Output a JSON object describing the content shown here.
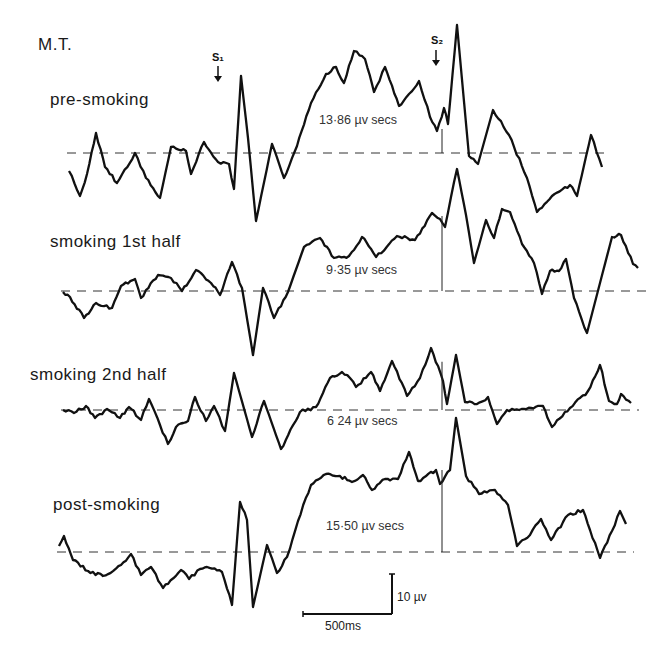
{
  "chart_data": {
    "type": "line",
    "title": "M.T.",
    "xlabel": "",
    "ylabel": "",
    "grid": false,
    "legend": "none",
    "stimulus_markers": [
      {
        "label": "S1",
        "x_px": 218
      },
      {
        "label": "S2",
        "x_px": 436
      }
    ],
    "scale_bar": {
      "time": "500ms",
      "amplitude": "10 µv"
    },
    "series": [
      {
        "name": "pre-smoking",
        "area_label": "13·86 µv secs",
        "baseline_y": 153,
        "points": [
          [
            69,
            171
          ],
          [
            80,
            196
          ],
          [
            87,
            174
          ],
          [
            96,
            133
          ],
          [
            105,
            167
          ],
          [
            117,
            183
          ],
          [
            135,
            153
          ],
          [
            146,
            178
          ],
          [
            160,
            198
          ],
          [
            171,
            147
          ],
          [
            186,
            151
          ],
          [
            191,
            174
          ],
          [
            204,
            142
          ],
          [
            218,
            162
          ],
          [
            229,
            164
          ],
          [
            234,
            189
          ],
          [
            241,
            76
          ],
          [
            248,
            138
          ],
          [
            256,
            221
          ],
          [
            272,
            144
          ],
          [
            284,
            178
          ],
          [
            297,
            146
          ],
          [
            311,
            103
          ],
          [
            326,
            74
          ],
          [
            336,
            67
          ],
          [
            344,
            83
          ],
          [
            354,
            51
          ],
          [
            365,
            59
          ],
          [
            374,
            92
          ],
          [
            385,
            67
          ],
          [
            399,
            106
          ],
          [
            419,
            81
          ],
          [
            430,
            117
          ],
          [
            437,
            131
          ],
          [
            444,
            108
          ],
          [
            448,
            124
          ],
          [
            457,
            25
          ],
          [
            469,
            156
          ],
          [
            478,
            164
          ],
          [
            493,
            110
          ],
          [
            509,
            135
          ],
          [
            527,
            178
          ],
          [
            537,
            212
          ],
          [
            552,
            196
          ],
          [
            570,
            185
          ],
          [
            577,
            196
          ],
          [
            591,
            135
          ],
          [
            602,
            167
          ]
        ]
      },
      {
        "name": "smoking 1st half",
        "area_label": "9·35 µv secs",
        "baseline_y": 291,
        "points": [
          [
            63,
            292
          ],
          [
            70,
            297
          ],
          [
            84,
            318
          ],
          [
            96,
            303
          ],
          [
            112,
            308
          ],
          [
            121,
            286
          ],
          [
            135,
            279
          ],
          [
            141,
            298
          ],
          [
            158,
            275
          ],
          [
            171,
            278
          ],
          [
            182,
            291
          ],
          [
            196,
            270
          ],
          [
            211,
            283
          ],
          [
            220,
            295
          ],
          [
            232,
            262
          ],
          [
            242,
            288
          ],
          [
            253,
            355
          ],
          [
            263,
            288
          ],
          [
            274,
            318
          ],
          [
            288,
            292
          ],
          [
            304,
            247
          ],
          [
            320,
            238
          ],
          [
            334,
            258
          ],
          [
            349,
            256
          ],
          [
            362,
            237
          ],
          [
            376,
            257
          ],
          [
            397,
            236
          ],
          [
            415,
            240
          ],
          [
            432,
            213
          ],
          [
            440,
            219
          ],
          [
            445,
            227
          ],
          [
            451,
            197
          ],
          [
            457,
            169
          ],
          [
            466,
            215
          ],
          [
            474,
            263
          ],
          [
            486,
            220
          ],
          [
            494,
            238
          ],
          [
            502,
            209
          ],
          [
            510,
            212
          ],
          [
            522,
            244
          ],
          [
            534,
            263
          ],
          [
            542,
            294
          ],
          [
            550,
            271
          ],
          [
            559,
            271
          ],
          [
            566,
            259
          ],
          [
            574,
            298
          ],
          [
            587,
            333
          ],
          [
            600,
            283
          ],
          [
            612,
            237
          ],
          [
            621,
            235
          ],
          [
            633,
            264
          ],
          [
            638,
            268
          ]
        ]
      },
      {
        "name": "smoking 2nd half",
        "area_label": "6·24 µv secs",
        "baseline_y": 410,
        "points": [
          [
            63,
            410
          ],
          [
            74,
            413
          ],
          [
            86,
            406
          ],
          [
            95,
            418
          ],
          [
            107,
            409
          ],
          [
            120,
            418
          ],
          [
            129,
            407
          ],
          [
            141,
            420
          ],
          [
            149,
            399
          ],
          [
            160,
            425
          ],
          [
            168,
            444
          ],
          [
            176,
            427
          ],
          [
            188,
            421
          ],
          [
            195,
            397
          ],
          [
            206,
            421
          ],
          [
            214,
            406
          ],
          [
            225,
            431
          ],
          [
            234,
            373
          ],
          [
            252,
            437
          ],
          [
            264,
            401
          ],
          [
            281,
            449
          ],
          [
            300,
            412
          ],
          [
            316,
            407
          ],
          [
            330,
            378
          ],
          [
            342,
            372
          ],
          [
            350,
            378
          ],
          [
            356,
            387
          ],
          [
            371,
            372
          ],
          [
            380,
            391
          ],
          [
            392,
            361
          ],
          [
            407,
            396
          ],
          [
            420,
            378
          ],
          [
            431,
            348
          ],
          [
            443,
            381
          ],
          [
            447,
            404
          ],
          [
            456,
            355
          ],
          [
            465,
            402
          ],
          [
            477,
            404
          ],
          [
            488,
            397
          ],
          [
            497,
            424
          ],
          [
            507,
            410
          ],
          [
            524,
            409
          ],
          [
            543,
            406
          ],
          [
            552,
            427
          ],
          [
            570,
            408
          ],
          [
            588,
            391
          ],
          [
            600,
            365
          ],
          [
            609,
            401
          ],
          [
            617,
            404
          ],
          [
            621,
            394
          ],
          [
            631,
            403
          ]
        ]
      },
      {
        "name": "post-smoking",
        "area_label": "15·50 µv secs",
        "baseline_y": 552,
        "points": [
          [
            59,
            546
          ],
          [
            64,
            536
          ],
          [
            73,
            560
          ],
          [
            88,
            571
          ],
          [
            103,
            576
          ],
          [
            121,
            565
          ],
          [
            131,
            554
          ],
          [
            141,
            575
          ],
          [
            151,
            567
          ],
          [
            163,
            588
          ],
          [
            181,
            570
          ],
          [
            189,
            579
          ],
          [
            200,
            569
          ],
          [
            207,
            567
          ],
          [
            222,
            572
          ],
          [
            232,
            605
          ],
          [
            240,
            502
          ],
          [
            247,
            520
          ],
          [
            253,
            607
          ],
          [
            267,
            545
          ],
          [
            277,
            573
          ],
          [
            287,
            557
          ],
          [
            298,
            521
          ],
          [
            311,
            485
          ],
          [
            326,
            474
          ],
          [
            340,
            476
          ],
          [
            352,
            482
          ],
          [
            363,
            475
          ],
          [
            372,
            490
          ],
          [
            385,
            479
          ],
          [
            398,
            479
          ],
          [
            409,
            452
          ],
          [
            418,
            481
          ],
          [
            436,
            470
          ],
          [
            440,
            484
          ],
          [
            450,
            470
          ],
          [
            456,
            418
          ],
          [
            466,
            476
          ],
          [
            479,
            494
          ],
          [
            495,
            490
          ],
          [
            508,
            505
          ],
          [
            517,
            546
          ],
          [
            530,
            535
          ],
          [
            541,
            519
          ],
          [
            551,
            540
          ],
          [
            568,
            515
          ],
          [
            583,
            510
          ],
          [
            590,
            530
          ],
          [
            600,
            558
          ],
          [
            612,
            531
          ],
          [
            620,
            511
          ],
          [
            626,
            524
          ]
        ]
      }
    ]
  },
  "labels": {
    "subject": "M.T.",
    "s1": "S₁",
    "s2": "S₂",
    "trace1": "pre-smoking",
    "trace2": "smoking 1st half",
    "trace3": "smoking 2nd half",
    "trace4": "post-smoking",
    "area1": "13·86 µv secs",
    "area2": "9·35 µv secs",
    "area3": "6 24 µv secs",
    "area4": "15·50 µv secs",
    "scale_amp": "10 µv",
    "scale_time": "500ms"
  }
}
